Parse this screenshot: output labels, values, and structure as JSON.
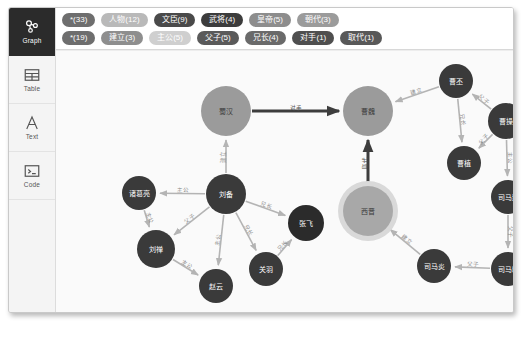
{
  "window": {
    "background": "#fbfbfb"
  },
  "sidebar": {
    "items": [
      {
        "label": "Graph",
        "icon": "graph-icon",
        "active": true
      },
      {
        "label": "Table",
        "icon": "table-icon",
        "active": false
      },
      {
        "label": "Text",
        "icon": "text-icon",
        "active": false
      },
      {
        "label": "Code",
        "icon": "code-icon",
        "active": false
      }
    ]
  },
  "tagbar": {
    "rows": [
      [
        {
          "label": "*(33)",
          "color": "#6e6e6e",
          "dim": false
        },
        {
          "label": "人物(12)",
          "color": "#b9b9b9",
          "dim": true
        },
        {
          "label": "文臣(9)",
          "color": "#4a4a4a",
          "dim": false
        },
        {
          "label": "武将(4)",
          "color": "#3c3c3c",
          "dim": false
        },
        {
          "label": "皇帝(5)",
          "color": "#8d8d8d",
          "dim": false
        },
        {
          "label": "朝代(3)",
          "color": "#9b9b9b",
          "dim": false
        }
      ],
      [
        {
          "label": "*(19)",
          "color": "#6e6e6e",
          "dim": false
        },
        {
          "label": "建立(3)",
          "color": "#8e8e8e",
          "dim": false
        },
        {
          "label": "主公(5)",
          "color": "#cfcfcf",
          "dim": true
        },
        {
          "label": "父子(5)",
          "color": "#5a5a5a",
          "dim": false
        },
        {
          "label": "兄长(4)",
          "color": "#6a6a6a",
          "dim": false
        },
        {
          "label": "对手(1)",
          "color": "#4f4f4f",
          "dim": false
        },
        {
          "label": "取代(1)",
          "color": "#585858",
          "dim": false
        }
      ]
    ]
  },
  "graph": {
    "colors": {
      "dynasty": "#9b9b9b",
      "person": "#3a3a3a",
      "person_dark": "#2b2b2b",
      "selected_fill": "#a8a8a8",
      "selected_ring": "#d9d9d9",
      "edge": "#b4b4b4",
      "edge_strong": "#3d3d3d"
    },
    "nodes": [
      {
        "id": "shuhan",
        "label": "蜀汉",
        "x": 170,
        "y": 60,
        "r": 25,
        "type": "dynasty",
        "selected": false
      },
      {
        "id": "caowei",
        "label": "曹魏",
        "x": 312,
        "y": 60,
        "r": 25,
        "type": "dynasty",
        "selected": false
      },
      {
        "id": "xijin",
        "label": "西晋",
        "x": 312,
        "y": 160,
        "r": 25,
        "type": "dynasty",
        "selected": true
      },
      {
        "id": "caopi",
        "label": "曹丕",
        "x": 400,
        "y": 30,
        "r": 17,
        "type": "person",
        "selected": false
      },
      {
        "id": "caocao",
        "label": "曹操",
        "x": 450,
        "y": 70,
        "r": 18,
        "type": "person",
        "selected": false
      },
      {
        "id": "caozhi",
        "label": "曹植",
        "x": 408,
        "y": 112,
        "r": 17,
        "type": "person",
        "selected": false
      },
      {
        "id": "simayi",
        "label": "司马懿",
        "x": 452,
        "y": 146,
        "r": 17,
        "type": "person",
        "selected": false
      },
      {
        "id": "simazhao",
        "label": "司马昭",
        "x": 452,
        "y": 218,
        "r": 17,
        "type": "person",
        "selected": false
      },
      {
        "id": "simayan",
        "label": "司马炎",
        "x": 378,
        "y": 215,
        "r": 17,
        "type": "person",
        "selected": false
      },
      {
        "id": "liubei",
        "label": "刘备",
        "x": 170,
        "y": 143,
        "r": 20,
        "type": "person",
        "selected": false
      },
      {
        "id": "zhugeliang",
        "label": "诸葛亮",
        "x": 83,
        "y": 142,
        "r": 17,
        "type": "person",
        "selected": false
      },
      {
        "id": "liushan",
        "label": "刘禅",
        "x": 100,
        "y": 198,
        "r": 19,
        "type": "person",
        "selected": false
      },
      {
        "id": "zhaoyun",
        "label": "赵云",
        "x": 160,
        "y": 235,
        "r": 17,
        "type": "person",
        "selected": false
      },
      {
        "id": "guanyu",
        "label": "关羽",
        "x": 210,
        "y": 218,
        "r": 17,
        "type": "person",
        "selected": false
      },
      {
        "id": "zhangfei",
        "label": "张飞",
        "x": 250,
        "y": 172,
        "r": 18,
        "type": "person_dark",
        "selected": false
      }
    ],
    "edges": [
      {
        "from": "shuhan",
        "to": "caowei",
        "label": "对手",
        "strong": true
      },
      {
        "from": "xijin",
        "to": "caowei",
        "label": "取代",
        "strong": true
      },
      {
        "from": "liubei",
        "to": "shuhan",
        "label": "建立",
        "strong": false
      },
      {
        "from": "caopi",
        "to": "caowei",
        "label": "建立",
        "strong": false
      },
      {
        "from": "caocao",
        "to": "caopi",
        "label": "父子",
        "strong": false
      },
      {
        "from": "caocao",
        "to": "caozhi",
        "label": "父子",
        "strong": false
      },
      {
        "from": "caopi",
        "to": "caozhi",
        "label": "兄长",
        "strong": false
      },
      {
        "from": "caocao",
        "to": "simayi",
        "label": "主公",
        "strong": false
      },
      {
        "from": "simayi",
        "to": "simazhao",
        "label": "父子",
        "strong": false
      },
      {
        "from": "simazhao",
        "to": "simayan",
        "label": "父子",
        "strong": false
      },
      {
        "from": "simayan",
        "to": "xijin",
        "label": "建立",
        "strong": false
      },
      {
        "from": "liubei",
        "to": "zhugeliang",
        "label": "主公",
        "strong": false
      },
      {
        "from": "liubei",
        "to": "liushan",
        "label": "父子",
        "strong": false
      },
      {
        "from": "liubei",
        "to": "zhaoyun",
        "label": "主公",
        "strong": false
      },
      {
        "from": "liubei",
        "to": "guanyu",
        "label": "兄长",
        "strong": false
      },
      {
        "from": "liubei",
        "to": "zhangfei",
        "label": "兄长",
        "strong": false
      },
      {
        "from": "zhugeliang",
        "to": "liushan",
        "label": "主公",
        "strong": false
      },
      {
        "from": "liushan",
        "to": "zhaoyun",
        "label": "主公",
        "strong": false
      },
      {
        "from": "guanyu",
        "to": "zhangfei",
        "label": "兄长",
        "strong": false
      }
    ]
  }
}
